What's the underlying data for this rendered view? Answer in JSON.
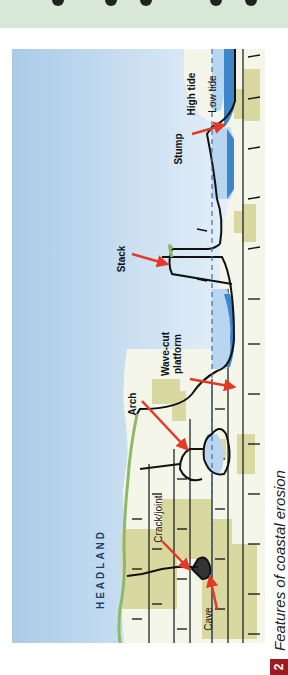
{
  "figure": {
    "number": "2",
    "caption": "Features of coastal erosion",
    "orientation": "rotated 90° counter-clockwise"
  },
  "labels": {
    "headland": "HEADLAND",
    "crack_joint": "Crack/joint",
    "cave": "Cave",
    "arch": "Arch",
    "wave_cut_platform_line1": "Wave-cut",
    "wave_cut_platform_line2": "platform",
    "stack": "Stack",
    "stump": "Stump",
    "high_tide": "High tide",
    "low_tide": "Low tide"
  },
  "colors": {
    "sky_top": "#a9cbe8",
    "sky_bottom": "#e8f2fa",
    "sea_light": "#b8d6ef",
    "sea_dark": "#3d86c9",
    "rock_fill": "#f4f6ea",
    "rock_patch": "#d9d8a0",
    "grass": "#8fb96a",
    "outline": "#111111",
    "arrow": "#e23a26",
    "tide_line": "#3c6fa5",
    "caption_badge": "#9b1d20",
    "top_band": "#d7e8d6"
  }
}
